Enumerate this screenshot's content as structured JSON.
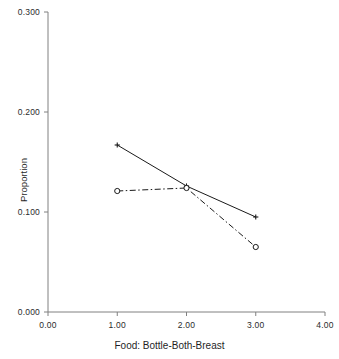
{
  "chart_data": {
    "type": "line",
    "title": "",
    "subtitle": "",
    "xlabel": "Food: Bottle-Both-Breast",
    "ylabel": "Proportion",
    "x": [
      1.0,
      2.0,
      3.0
    ],
    "xlim": [
      0.0,
      4.0
    ],
    "ylim": [
      0.0,
      0.3
    ],
    "xticks": [
      "0.00",
      "1.00",
      "2.00",
      "3.00",
      "4.00"
    ],
    "xtick_values": [
      0.0,
      1.0,
      2.0,
      3.0,
      4.0
    ],
    "yticks": [
      "0.000",
      "0.100",
      "0.200",
      "0.300"
    ],
    "ytick_values": [
      0.0,
      0.1,
      0.2,
      0.3
    ],
    "grid": false,
    "legend": "none",
    "series": [
      {
        "name": "series-solid",
        "linestyle": "solid",
        "marker": "plus",
        "color": "#1a1a1a",
        "values": [
          0.167,
          0.126,
          0.095
        ]
      },
      {
        "name": "series-dashdot",
        "linestyle": "dash-dot",
        "marker": "open-circle",
        "color": "#1a1a1a",
        "values": [
          0.121,
          0.124,
          0.065
        ]
      }
    ],
    "axis_color": "#808080",
    "annotations": []
  },
  "figure": {
    "background": "#ffffff"
  }
}
